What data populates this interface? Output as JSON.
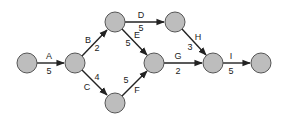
{
  "diagram": {
    "type": "activity-on-arrow network",
    "node_style": {
      "fill": "#bdbdbd",
      "stroke": "#555555",
      "radius": 10
    },
    "edge_color": "#222222",
    "nodes": [
      {
        "id": "n1",
        "x": 27,
        "y": 63
      },
      {
        "id": "n2",
        "x": 75,
        "y": 63
      },
      {
        "id": "n3",
        "x": 115,
        "y": 22
      },
      {
        "id": "n4",
        "x": 175,
        "y": 22
      },
      {
        "id": "n5",
        "x": 154,
        "y": 63
      },
      {
        "id": "n6",
        "x": 115,
        "y": 103
      },
      {
        "id": "n7",
        "x": 213,
        "y": 63
      },
      {
        "id": "n8",
        "x": 261,
        "y": 63
      }
    ],
    "activities": [
      {
        "label": "A",
        "duration": "5",
        "from": "n1",
        "to": "n2"
      },
      {
        "label": "B",
        "duration": "2",
        "from": "n2",
        "to": "n3"
      },
      {
        "label": "C",
        "duration": "4",
        "from": "n2",
        "to": "n6"
      },
      {
        "label": "D",
        "duration": "5",
        "from": "n3",
        "to": "n4"
      },
      {
        "label": "E",
        "duration": "5",
        "from": "n3",
        "to": "n5"
      },
      {
        "label": "F",
        "duration": "5",
        "from": "n6",
        "to": "n5"
      },
      {
        "label": "G",
        "duration": "2",
        "from": "n5",
        "to": "n7"
      },
      {
        "label": "H",
        "duration": "3",
        "from": "n4",
        "to": "n7"
      },
      {
        "label": "I",
        "duration": "5",
        "from": "n7",
        "to": "n8"
      }
    ]
  }
}
